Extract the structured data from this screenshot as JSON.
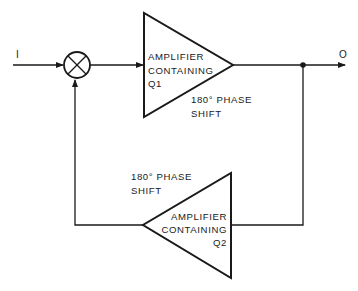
{
  "diagram": {
    "type": "feedback-amplifier-block-diagram",
    "stroke_color": "#1a1a1a",
    "background": "#ffffff",
    "input_label": "I",
    "output_label": "O",
    "summing_junction": {
      "symbol": "multiply-circle"
    },
    "amplifier_1": {
      "line1": "AMPLIFIER",
      "line2": "CONTAINING",
      "line3": "Q1",
      "phase_line1": "180° PHASE",
      "phase_line2": "SHIFT",
      "direction": "right"
    },
    "amplifier_2": {
      "line1": "AMPLIFIER",
      "line2": "CONTAINING",
      "line3": "Q2",
      "phase_line1": "180° PHASE",
      "phase_line2": "SHIFT",
      "direction": "left"
    }
  }
}
